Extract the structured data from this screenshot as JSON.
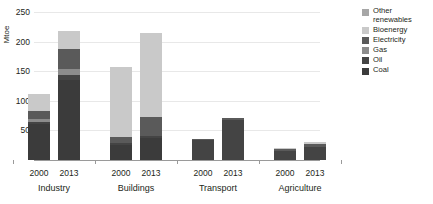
{
  "chart_data": {
    "type": "bar",
    "subtype": "stacked-grouped",
    "title": "",
    "xlabel": "",
    "ylabel": "Mtoe",
    "ylim": [
      0,
      250
    ],
    "yticks": [
      50,
      100,
      150,
      200,
      250
    ],
    "grid": true,
    "legend_position": "right",
    "groups": [
      "Industry",
      "Buildings",
      "Transport",
      "Agriculture"
    ],
    "years": [
      "2000",
      "2013"
    ],
    "categories": [
      "Industry 2000",
      "Industry 2013",
      "Buildings 2000",
      "Buildings 2013",
      "Transport 2000",
      "Transport 2013",
      "Agriculture 2000",
      "Agriculture 2013"
    ],
    "series": [
      {
        "name": "Coal",
        "color": "#3b3b3b",
        "values": [
          60,
          136,
          26,
          38,
          0,
          0,
          0,
          0
        ]
      },
      {
        "name": "Oil",
        "color": "#444444",
        "values": [
          4,
          8,
          3,
          3,
          33,
          68,
          15,
          22
        ]
      },
      {
        "name": "Gas",
        "color": "#8c8c8c",
        "values": [
          5,
          9,
          0,
          0,
          0,
          0,
          0,
          0
        ]
      },
      {
        "name": "Electricity",
        "color": "#5a5a5a",
        "values": [
          13,
          35,
          10,
          32,
          2,
          3,
          4,
          5
        ]
      },
      {
        "name": "Bioenergy",
        "color": "#c9c9c9",
        "values": [
          29,
          30,
          119,
          142,
          0,
          0,
          2,
          3
        ]
      },
      {
        "name": "Other renewables",
        "color": "#a6a6a6",
        "values": [
          0,
          0,
          0,
          0,
          0,
          0,
          0,
          0
        ]
      }
    ],
    "totals": [
      111,
      218,
      158,
      215,
      35,
      71,
      21,
      30
    ]
  },
  "legend": {
    "items": [
      {
        "label": "Other renewables",
        "color": "#a6a6a6"
      },
      {
        "label": "Bioenergy",
        "color": "#c9c9c9"
      },
      {
        "label": "Electricity",
        "color": "#5a5a5a"
      },
      {
        "label": "Gas",
        "color": "#8c8c8c"
      },
      {
        "label": "Oil",
        "color": "#444444"
      },
      {
        "label": "Coal",
        "color": "#3b3b3b"
      }
    ]
  },
  "axis": {
    "ylabel": "Mtoe",
    "yticks": [
      "250",
      "200",
      "150",
      "100",
      "50"
    ]
  },
  "xaxis": {
    "groups": [
      {
        "name": "Industry",
        "years": [
          "2000",
          "2013"
        ]
      },
      {
        "name": "Buildings",
        "years": [
          "2000",
          "2013"
        ]
      },
      {
        "name": "Transport",
        "years": [
          "2000",
          "2013"
        ]
      },
      {
        "name": "Agriculture",
        "years": [
          "2000",
          "2013"
        ]
      }
    ]
  }
}
